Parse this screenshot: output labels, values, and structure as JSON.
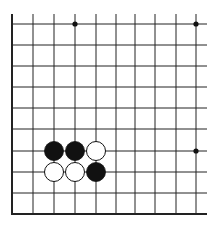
{
  "diagram": {
    "type": "go-board-fragment",
    "background": "#ffffff",
    "line_color": "#222222",
    "columns_x": [
      12,
      33,
      54,
      75,
      96,
      116,
      135,
      155,
      176,
      196
    ],
    "rows_y": [
      24,
      45,
      66,
      87,
      108,
      129,
      151,
      172,
      193,
      214
    ],
    "grid_top": 14,
    "grid_right": 207,
    "left_edge_x": 12,
    "bottom_edge_y": 214,
    "star_points": [
      {
        "x": 75,
        "y": 24
      },
      {
        "x": 196,
        "y": 24
      },
      {
        "x": 196,
        "y": 151
      }
    ],
    "stones": [
      {
        "color": "black",
        "col": 2,
        "row": 6
      },
      {
        "color": "black",
        "col": 3,
        "row": 6
      },
      {
        "color": "white",
        "col": 4,
        "row": 6
      },
      {
        "color": "white",
        "col": 2,
        "row": 7
      },
      {
        "color": "white",
        "col": 3,
        "row": 7
      },
      {
        "color": "black",
        "col": 4,
        "row": 7
      }
    ],
    "stone_radius": 9.5
  }
}
